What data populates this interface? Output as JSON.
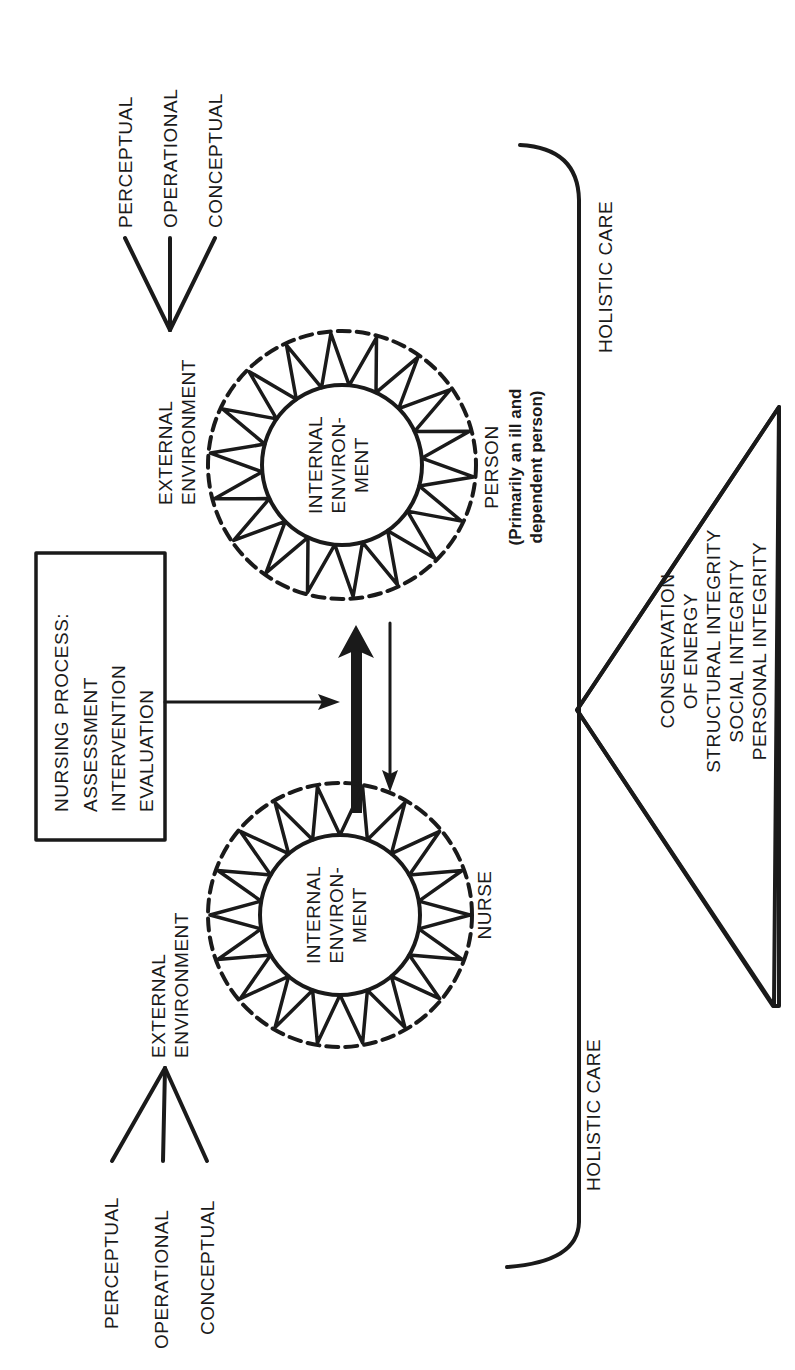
{
  "diagram": {
    "colors": {
      "ink": "#1a1a1a",
      "background": "#ffffff"
    },
    "external_levels_top": [
      "PERCEPTUAL",
      "OPERATIONAL",
      "CONCEPTUAL"
    ],
    "external_levels_bottom": [
      "PERCEPTUAL",
      "OPERATIONAL",
      "CONCEPTUAL"
    ],
    "person": {
      "external": [
        "EXTERNAL",
        "ENVIRONMENT"
      ],
      "internal": [
        "INTERNAL",
        "ENVIRON-",
        "MENT"
      ],
      "label": "PERSON",
      "sublabel": [
        "(Primarily an ill and",
        "dependent person)"
      ]
    },
    "nurse": {
      "external": [
        "EXTERNAL",
        "ENVIRONMENT"
      ],
      "internal": [
        "INTERNAL",
        "ENVIRON-",
        "MENT"
      ],
      "label": "NURSE"
    },
    "nursing_process": {
      "lines": [
        "NURSING PROCESS:",
        "ASSESSMENT",
        "INTERVENTION",
        "EVALUATION"
      ]
    },
    "holistic_care": [
      "HOLISTIC CARE",
      "HOLISTIC CARE"
    ],
    "conservation_principles": {
      "lines": [
        "CONSERVATION",
        "OF ENERGY",
        "STRUCTURAL INTEGRITY",
        "SOCIAL INTEGRITY",
        "PERSONAL INTEGRITY"
      ]
    }
  }
}
